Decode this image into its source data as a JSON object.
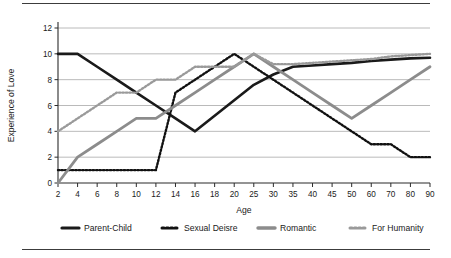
{
  "figure": {
    "background": "#ffffff",
    "rule_color": "#3c3c3c"
  },
  "chart_data": {
    "type": "line",
    "title": "",
    "xlabel": "Age",
    "ylabel": "Experience of Love",
    "categories": [
      "2",
      "4",
      "6",
      "8",
      "10",
      "12",
      "14",
      "16",
      "18",
      "20",
      "25",
      "30",
      "35",
      "40",
      "45",
      "50",
      "60",
      "70",
      "80",
      "90"
    ],
    "ylim": [
      0,
      12
    ],
    "yticks": [
      "0",
      "2",
      "4",
      "6",
      "8",
      "10",
      "12"
    ],
    "grid": true,
    "legend_position": "bottom",
    "series": [
      {
        "name": "Parent-Child",
        "style": "solid",
        "color": "#1a1a1a",
        "width": 2.6,
        "values": [
          10,
          10,
          9,
          8,
          7,
          6,
          5,
          4,
          5.2,
          6.4,
          7.6,
          8.4,
          9,
          9.1,
          9.2,
          9.3,
          9.45,
          9.55,
          9.65,
          9.7
        ]
      },
      {
        "name": "Sexual Deisre",
        "style": "dotted",
        "color": "#111111",
        "width": 2.4,
        "values": [
          1,
          1,
          1,
          1,
          1,
          1,
          7,
          8,
          9,
          10,
          9,
          8,
          7,
          6,
          5,
          4,
          3,
          3,
          2,
          2
        ]
      },
      {
        "name": "Romantic",
        "style": "solid",
        "color": "#8c8c8c",
        "width": 2.8,
        "values": [
          0,
          2,
          3,
          4,
          5,
          5,
          6,
          7,
          8,
          9,
          10,
          9,
          8,
          7,
          6,
          5,
          6,
          7,
          8,
          9
        ]
      },
      {
        "name": "For Humanity",
        "style": "dotted",
        "color": "#9a9a9a",
        "width": 2.4,
        "values": [
          4,
          5,
          6,
          7,
          7,
          8,
          8,
          9,
          9,
          9,
          10,
          9.2,
          9.2,
          9.3,
          9.4,
          9.5,
          9.6,
          9.8,
          9.9,
          10
        ]
      }
    ]
  },
  "legend": {
    "items": [
      {
        "label": "Parent-Child",
        "swatch": "solid-black-line-swatch"
      },
      {
        "label": "Sexual Deisre",
        "swatch": "dotted-black-line-swatch"
      },
      {
        "label": "Romantic",
        "swatch": "solid-gray-line-swatch"
      },
      {
        "label": "For Humanity",
        "swatch": "dotted-gray-line-swatch"
      }
    ]
  }
}
